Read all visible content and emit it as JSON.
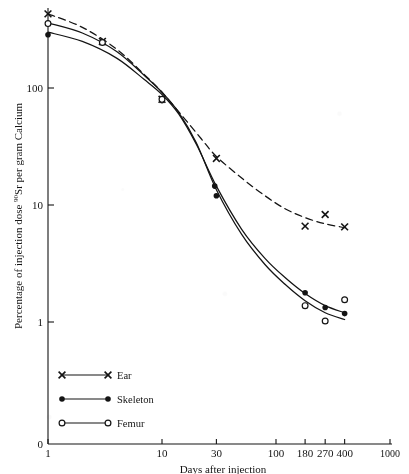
{
  "figure": {
    "background_color": "#ffffff",
    "ink_color": "#141414"
  },
  "axes": {
    "x": {
      "title": "Days after injection",
      "scale": "log",
      "range": [
        1,
        1000
      ],
      "tick_values": [
        1,
        10,
        30,
        100,
        180,
        270,
        400,
        1000
      ],
      "tick_labels": [
        "1",
        "10",
        "30",
        "100",
        "180",
        "270",
        "400",
        "1000"
      ]
    },
    "y": {
      "title_parts": {
        "before": "Percentage of injection dose ",
        "superscript": "90",
        "after": "Sr per gram Calcium"
      },
      "title": "Percentage of injection dose 90Sr per gram Calcium",
      "scale": "log",
      "range": [
        1,
        500
      ],
      "tick_values": [
        1,
        10,
        100
      ],
      "tick_labels": [
        "1",
        "10",
        "100"
      ],
      "origin_label": "0"
    }
  },
  "legend": {
    "position": "lower-left",
    "entries": [
      {
        "label": "Ear",
        "marker": "cross",
        "line": "solid",
        "curve_style": "dashed"
      },
      {
        "label": "Skeleton",
        "marker": "filled-circle",
        "line": "solid",
        "curve_style": "solid"
      },
      {
        "label": "Femur",
        "marker": "open-circle",
        "line": "solid",
        "curve_style": "solid"
      }
    ]
  },
  "chart_data": {
    "type": "scatter",
    "title": "",
    "xlabel": "Days after injection",
    "ylabel": "Percentage of injection dose 90Sr per gram Calcium",
    "xscale": "log",
    "yscale": "log",
    "xlim": [
      1,
      1000
    ],
    "ylim": [
      1,
      500
    ],
    "xticks": [
      1,
      10,
      30,
      100,
      180,
      270,
      400,
      1000
    ],
    "yticks": [
      1,
      10,
      100
    ],
    "grid": false,
    "legend_position": "lower-left",
    "series": [
      {
        "name": "Ear",
        "marker": "cross",
        "line_style": "dashed",
        "points": [
          {
            "x": 1,
            "y": 430
          },
          {
            "x": 3,
            "y": 250
          },
          {
            "x": 10,
            "y": 80
          },
          {
            "x": 30,
            "y": 25
          },
          {
            "x": 180,
            "y": 6.6
          },
          {
            "x": 270,
            "y": 8.3
          },
          {
            "x": 400,
            "y": 6.5
          }
        ],
        "curve": [
          {
            "x": 1,
            "y": 430
          },
          {
            "x": 2,
            "y": 330
          },
          {
            "x": 4,
            "y": 215
          },
          {
            "x": 7,
            "y": 130
          },
          {
            "x": 10,
            "y": 92
          },
          {
            "x": 15,
            "y": 58
          },
          {
            "x": 22,
            "y": 37
          },
          {
            "x": 30,
            "y": 26
          },
          {
            "x": 50,
            "y": 17
          },
          {
            "x": 80,
            "y": 12
          },
          {
            "x": 120,
            "y": 9.3
          },
          {
            "x": 180,
            "y": 7.8
          },
          {
            "x": 270,
            "y": 6.9
          },
          {
            "x": 400,
            "y": 6.4
          }
        ]
      },
      {
        "name": "Skeleton",
        "marker": "filled-circle",
        "line_style": "solid",
        "points": [
          {
            "x": 1,
            "y": 285
          },
          {
            "x": 10,
            "y": 78
          },
          {
            "x": 29,
            "y": 14.5
          },
          {
            "x": 30,
            "y": 12
          },
          {
            "x": 180,
            "y": 1.78
          },
          {
            "x": 270,
            "y": 1.33
          },
          {
            "x": 400,
            "y": 1.18
          }
        ],
        "curve": [
          {
            "x": 1,
            "y": 300
          },
          {
            "x": 2,
            "y": 250
          },
          {
            "x": 4,
            "y": 180
          },
          {
            "x": 7,
            "y": 118
          },
          {
            "x": 10,
            "y": 88
          },
          {
            "x": 14,
            "y": 60
          },
          {
            "x": 20,
            "y": 33
          },
          {
            "x": 30,
            "y": 14.5
          },
          {
            "x": 50,
            "y": 6.2
          },
          {
            "x": 80,
            "y": 3.5
          },
          {
            "x": 120,
            "y": 2.4
          },
          {
            "x": 180,
            "y": 1.75
          },
          {
            "x": 270,
            "y": 1.38
          },
          {
            "x": 400,
            "y": 1.2
          }
        ]
      },
      {
        "name": "Femur",
        "marker": "open-circle",
        "line_style": "solid",
        "points": [
          {
            "x": 1,
            "y": 355
          },
          {
            "x": 3,
            "y": 245
          },
          {
            "x": 10,
            "y": 80
          },
          {
            "x": 180,
            "y": 1.38
          },
          {
            "x": 270,
            "y": 1.02
          },
          {
            "x": 400,
            "y": 1.55
          }
        ],
        "curve": [
          {
            "x": 1,
            "y": 360
          },
          {
            "x": 2,
            "y": 295
          },
          {
            "x": 4,
            "y": 205
          },
          {
            "x": 7,
            "y": 128
          },
          {
            "x": 10,
            "y": 92
          },
          {
            "x": 14,
            "y": 62
          },
          {
            "x": 20,
            "y": 34
          },
          {
            "x": 30,
            "y": 13.5
          },
          {
            "x": 50,
            "y": 5.6
          },
          {
            "x": 80,
            "y": 3.1
          },
          {
            "x": 120,
            "y": 2.1
          },
          {
            "x": 180,
            "y": 1.52
          },
          {
            "x": 270,
            "y": 1.2
          },
          {
            "x": 400,
            "y": 1.05
          }
        ]
      }
    ]
  }
}
